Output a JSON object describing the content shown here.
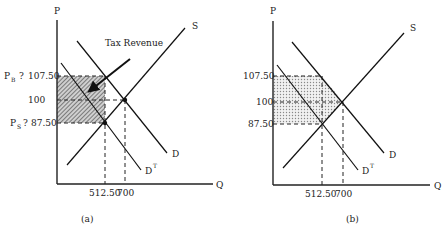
{
  "panels": [
    {
      "id": "a",
      "caption": "(a)",
      "y_axis_label": "P",
      "x_axis_label": "Q",
      "annotation": "Tax Revenue",
      "price_labels": {
        "pb_prefix": "P",
        "pb_sub": "B",
        "pb_sep": "?",
        "pb_value": "107.50",
        "eq_value": "100",
        "ps_prefix": "P",
        "ps_sub": "S",
        "ps_sep": "?",
        "ps_value": "87.50"
      },
      "quantity_labels": {
        "q_tax": "512.50",
        "q_eq": "700"
      },
      "curves": {
        "supply": "S",
        "demand": "D",
        "demand_tax": "D",
        "demand_tax_sup": "T"
      },
      "shading": "hatched"
    },
    {
      "id": "b",
      "caption": "(b)",
      "y_axis_label": "P",
      "x_axis_label": "Q",
      "price_labels": {
        "pb_value": "107.50",
        "eq_value": "100",
        "ps_value": "87.50"
      },
      "quantity_labels": {
        "q_tax": "512.50",
        "q_eq": "700"
      },
      "curves": {
        "supply": "S",
        "demand": "D",
        "demand_tax": "D",
        "demand_tax_sup": "T"
      },
      "shading": "dotted"
    }
  ],
  "values": {
    "price_buyers": 107.5,
    "price_equilibrium": 100,
    "price_sellers": 87.5,
    "quantity_with_tax": 512.5,
    "quantity_equilibrium": 700
  },
  "colors": {
    "ink": "#222222",
    "hatch": "#6a6a6a",
    "dots": "#8a8a8a",
    "background": "#ffffff"
  }
}
